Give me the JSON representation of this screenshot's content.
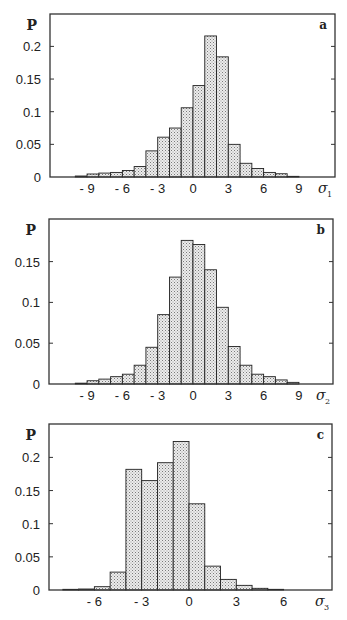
{
  "figure": {
    "caption_visible_fragment": ""
  },
  "chart_data": [
    {
      "type": "bar",
      "panel": "a",
      "title": "",
      "ylabel": "P",
      "xlabel": "σ1",
      "xlabel_symbol": "σ",
      "xlabel_subscript": "1",
      "ylim": [
        0,
        0.23
      ],
      "xlim": [
        -12.5,
        11.8
      ],
      "yticks": [
        0,
        0.05,
        0.1,
        0.15,
        0.2
      ],
      "ytick_labels": [
        "0",
        "0.05",
        "0.1",
        "0.15",
        "0.2"
      ],
      "xticks": [
        -9,
        -6,
        -3,
        0,
        3,
        6,
        9
      ],
      "xtick_labels": [
        "- 9",
        "- 6",
        "- 3",
        "0",
        "3",
        "6",
        "9"
      ],
      "grid": false,
      "bin_edges": [
        -10,
        -9,
        -8,
        -7,
        -6,
        -5,
        -4,
        -3,
        -2,
        -1,
        0,
        1,
        2,
        3,
        4,
        5,
        6,
        7,
        8,
        9
      ],
      "values": [
        0.0015,
        0.0046,
        0.006,
        0.007,
        0.01,
        0.016,
        0.04,
        0.061,
        0.075,
        0.106,
        0.14,
        0.216,
        0.184,
        0.05,
        0.021,
        0.013,
        0.007,
        0.005,
        0.001
      ]
    },
    {
      "type": "bar",
      "panel": "b",
      "title": "",
      "ylabel": "P",
      "xlabel": "σ2",
      "xlabel_symbol": "σ",
      "xlabel_subscript": "2",
      "ylim": [
        0,
        0.19
      ],
      "xlim": [
        -12.5,
        11.8
      ],
      "yticks": [
        0,
        0.05,
        0.1,
        0.15
      ],
      "ytick_labels": [
        "0",
        "0.05",
        "0.1",
        "0.15"
      ],
      "xticks": [
        -9,
        -6,
        -3,
        0,
        3,
        6,
        9
      ],
      "xtick_labels": [
        "- 9",
        "- 6",
        "- 3",
        "0",
        "3",
        "6",
        "9"
      ],
      "grid": false,
      "bin_edges": [
        -10,
        -9,
        -8,
        -7,
        -6,
        -5,
        -4,
        -3,
        -2,
        -1,
        0,
        1,
        2,
        3,
        4,
        5,
        6,
        7,
        8,
        9
      ],
      "values": [
        0.001,
        0.004,
        0.006,
        0.009,
        0.012,
        0.023,
        0.045,
        0.085,
        0.131,
        0.176,
        0.171,
        0.14,
        0.094,
        0.046,
        0.023,
        0.012,
        0.009,
        0.005,
        0.002
      ]
    },
    {
      "type": "bar",
      "panel": "c",
      "title": "",
      "ylabel": "P",
      "xlabel": "σ3",
      "xlabel_symbol": "σ",
      "xlabel_subscript": "3",
      "ylim": [
        0,
        0.24
      ],
      "xlim": [
        -9.1,
        8.9
      ],
      "yticks": [
        0,
        0.05,
        0.1,
        0.15,
        0.2
      ],
      "ytick_labels": [
        "0",
        "0.05",
        "0.1",
        "0.15",
        "0.2"
      ],
      "xticks": [
        -6,
        -3,
        0,
        3,
        6
      ],
      "xtick_labels": [
        "- 6",
        "- 3",
        "0",
        "3",
        "6"
      ],
      "grid": false,
      "bin_edges": [
        -8,
        -7,
        -6,
        -5,
        -4,
        -3,
        -2,
        -1,
        0,
        1,
        2,
        3,
        4,
        5,
        6
      ],
      "values": [
        0.001,
        0.0015,
        0.005,
        0.027,
        0.182,
        0.165,
        0.192,
        0.224,
        0.13,
        0.036,
        0.016,
        0.007,
        0.0025,
        0.001
      ]
    }
  ],
  "layout": {
    "panels": [
      {
        "left": 50,
        "right": 335,
        "top": 14,
        "bottom": 177,
        "x0px": 193,
        "px_per_unit": 11.77,
        "px_per_p": 653
      },
      {
        "left": 49,
        "right": 333,
        "top": 219,
        "bottom": 384,
        "x0px": 193,
        "px_per_unit": 11.77,
        "px_per_p": 816
      },
      {
        "left": 49,
        "right": 332,
        "top": 424,
        "bottom": 590,
        "x0px": 189,
        "px_per_unit": 15.77,
        "px_per_p": 663
      }
    ],
    "colors": {
      "frame": "#333333",
      "bar_stroke": "#222222",
      "bar_fill": "#e6e6e6",
      "stipple": "#7a7a7a"
    }
  }
}
